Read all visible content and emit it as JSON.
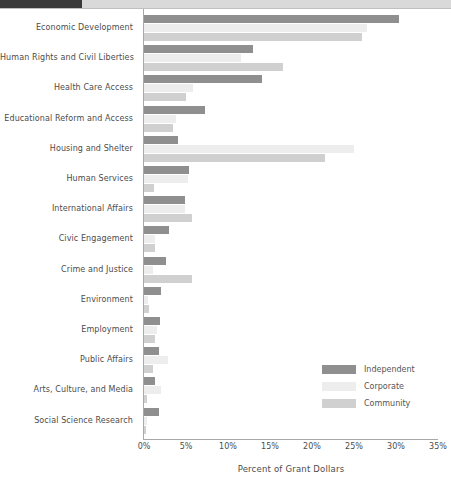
{
  "header": {
    "dark_block_color": "#3a3a3a",
    "light_block_color": "#d9d9d9"
  },
  "legend": {
    "position": "inside-bottom-right",
    "entries": [
      {
        "label": "Independent",
        "color": "#8f8f8f"
      },
      {
        "label": "Corporate",
        "color": "#ededed"
      },
      {
        "label": "Community",
        "color": "#d0d0d0"
      }
    ]
  },
  "chart_data": {
    "type": "bar",
    "orientation": "horizontal",
    "title": "",
    "subtitle": "",
    "xlabel": "Percent of Grant Dollars",
    "ylabel": "",
    "xlim": [
      0,
      35
    ],
    "xticks": [
      "0%",
      "5%",
      "10%",
      "15%",
      "20%",
      "25%",
      "30%",
      "35%"
    ],
    "xtick_values": [
      0,
      5,
      10,
      15,
      20,
      25,
      30,
      35
    ],
    "grid": false,
    "legend_position": "bottom-right",
    "categories": [
      "Economic Development",
      "Human Rights and Civil Liberties",
      "Health Care Access",
      "Educational Reform and Access",
      "Housing and Shelter",
      "Human Services",
      "International Affairs",
      "Civic Engagement",
      "Crime and Justice",
      "Environment",
      "Employment",
      "Public Affairs",
      "Arts, Culture, and Media",
      "Social Science Research"
    ],
    "series": [
      {
        "name": "Independent",
        "color": "#8f8f8f",
        "values": [
          30.3,
          13.0,
          14.0,
          7.3,
          4.0,
          5.3,
          4.9,
          3.0,
          2.6,
          2.0,
          1.9,
          1.8,
          1.3,
          1.8
        ]
      },
      {
        "name": "Corporate",
        "color": "#ededed",
        "values": [
          26.5,
          11.5,
          5.8,
          3.8,
          25.0,
          5.2,
          4.9,
          1.3,
          1.1,
          0.5,
          1.5,
          2.8,
          2.0,
          0.3
        ]
      },
      {
        "name": "Community",
        "color": "#d0d0d0",
        "values": [
          26.0,
          16.5,
          5.0,
          3.5,
          21.5,
          1.2,
          5.7,
          1.3,
          5.7,
          0.6,
          1.3,
          1.1,
          0.3,
          0.2
        ]
      }
    ]
  }
}
